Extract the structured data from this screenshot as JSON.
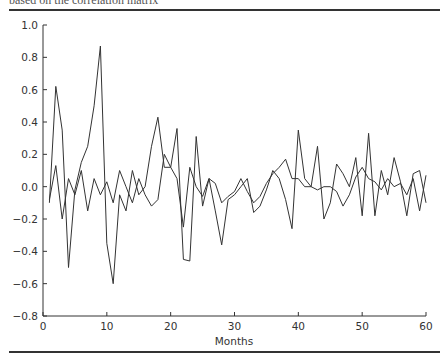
{
  "caption": "based on the correlation matrix",
  "chart_data": {
    "type": "line",
    "title": "",
    "xlabel": "Months",
    "ylabel": "",
    "xlim": [
      0,
      60
    ],
    "ylim": [
      -0.8,
      1.0
    ],
    "xticks": [
      0,
      10,
      20,
      30,
      40,
      50,
      60
    ],
    "yticks": [
      -0.8,
      -0.6,
      -0.4,
      -0.2,
      0.0,
      0.2,
      0.4,
      0.6,
      0.8,
      1.0
    ],
    "ytick_labels": [
      "−0.8",
      "−0.6",
      "−0.4",
      "−0.2",
      "0.0",
      "0.2",
      "0.4",
      "0.6",
      "0.8",
      "1.0"
    ],
    "grid": false,
    "legend": null,
    "x": [
      1,
      2,
      3,
      4,
      5,
      6,
      7,
      8,
      9,
      10,
      11,
      12,
      13,
      14,
      15,
      16,
      17,
      18,
      19,
      20,
      21,
      22,
      23,
      24,
      25,
      26,
      27,
      28,
      29,
      30,
      31,
      32,
      33,
      34,
      35,
      36,
      37,
      38,
      39,
      40,
      41,
      42,
      43,
      44,
      45,
      46,
      47,
      48,
      49,
      50,
      51,
      52,
      53,
      54,
      55,
      56,
      57,
      58,
      59,
      60
    ],
    "series": [
      {
        "name": "Series A (volatile)",
        "color": "#333333",
        "values": [
          -0.1,
          0.62,
          0.35,
          -0.5,
          -0.02,
          0.15,
          0.25,
          0.5,
          0.87,
          -0.35,
          -0.6,
          -0.05,
          -0.15,
          0.1,
          -0.05,
          0.0,
          0.25,
          0.43,
          0.12,
          0.12,
          0.36,
          -0.45,
          -0.46,
          0.31,
          -0.12,
          0.05,
          -0.15,
          -0.36,
          -0.08,
          -0.05,
          0.0,
          0.05,
          -0.16,
          -0.12,
          -0.02,
          0.1,
          0.05,
          -0.08,
          -0.26,
          0.35,
          0.05,
          0.0,
          0.25,
          -0.2,
          -0.1,
          0.14,
          0.08,
          0.0,
          0.18,
          -0.18,
          0.33,
          -0.18,
          0.1,
          -0.05,
          0.18,
          0.03,
          -0.18,
          0.08,
          0.1,
          -0.1
        ]
      },
      {
        "name": "Series B (calm)",
        "color": "#333333",
        "values": [
          -0.08,
          0.13,
          -0.2,
          0.05,
          -0.05,
          0.1,
          -0.15,
          0.05,
          -0.05,
          0.03,
          -0.1,
          0.1,
          0.0,
          -0.1,
          0.05,
          -0.05,
          -0.12,
          -0.08,
          0.2,
          0.12,
          0.05,
          -0.25,
          0.12,
          0.0,
          -0.06,
          0.05,
          0.02,
          -0.1,
          -0.06,
          -0.03,
          0.05,
          -0.03,
          -0.1,
          -0.06,
          0.02,
          0.08,
          0.12,
          0.17,
          0.05,
          0.05,
          0.0,
          0.0,
          -0.02,
          0.0,
          0.0,
          -0.03,
          -0.12,
          -0.05,
          0.06,
          0.12,
          0.05,
          0.03,
          -0.02,
          0.05,
          0.0,
          0.02,
          -0.05,
          0.05,
          -0.15,
          0.07
        ]
      }
    ]
  }
}
